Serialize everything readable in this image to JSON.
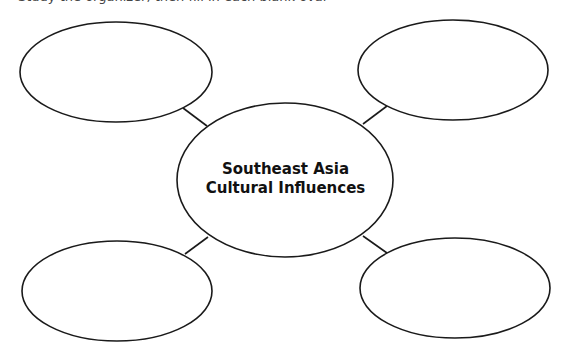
{
  "header": {
    "cropped_text": "Study the organizer, then fill in each blank oval"
  },
  "diagram": {
    "type": "concept-web",
    "center": {
      "line1": "Southeast Asia",
      "line2": "Cultural Influences",
      "ellipse": {
        "cx": 285,
        "cy": 180,
        "rx": 108,
        "ry": 77
      }
    },
    "nodes": [
      {
        "id": "top-left",
        "text": "",
        "ellipse": {
          "cx": 116,
          "cy": 72,
          "rx": 96,
          "ry": 50
        },
        "connector": {
          "x1": 183,
          "y1": 108,
          "x2": 207,
          "y2": 126
        }
      },
      {
        "id": "top-right",
        "text": "",
        "ellipse": {
          "cx": 453,
          "cy": 70,
          "rx": 95,
          "ry": 50
        },
        "connector": {
          "x1": 363,
          "y1": 124,
          "x2": 387,
          "y2": 106
        }
      },
      {
        "id": "bottom-left",
        "text": "",
        "ellipse": {
          "cx": 117,
          "cy": 291,
          "rx": 95,
          "ry": 50
        },
        "connector": {
          "x1": 185,
          "y1": 254,
          "x2": 208,
          "y2": 237
        }
      },
      {
        "id": "bottom-right",
        "text": "",
        "ellipse": {
          "cx": 455,
          "cy": 288,
          "rx": 95,
          "ry": 50
        },
        "connector": {
          "x1": 363,
          "y1": 236,
          "x2": 387,
          "y2": 253
        }
      }
    ],
    "colors": {
      "stroke": "#1a1a1a",
      "fill": "#ffffff",
      "text": "#111111"
    }
  }
}
